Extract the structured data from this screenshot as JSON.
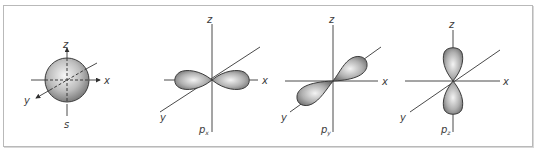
{
  "figure": {
    "colors": {
      "frame": "#b9b9b9",
      "axis": "#4a4a4a",
      "lobe_light": "#f2f2f2",
      "lobe_dark": "#7a7a7a"
    },
    "panels": [
      {
        "id": "s",
        "orbital_label": "s",
        "orbital_sub": "",
        "axis_labels": {
          "x": "x",
          "y": "y",
          "z": "z"
        }
      },
      {
        "id": "px",
        "orbital_label": "p",
        "orbital_sub": "x",
        "axis_labels": {
          "x": "x",
          "y": "y",
          "z": "z"
        }
      },
      {
        "id": "py",
        "orbital_label": "p",
        "orbital_sub": "y",
        "axis_labels": {
          "x": "x",
          "y": "y",
          "z": "z"
        }
      },
      {
        "id": "pz",
        "orbital_label": "p",
        "orbital_sub": "z",
        "axis_labels": {
          "x": "x",
          "y": "y",
          "z": "z"
        }
      }
    ]
  }
}
